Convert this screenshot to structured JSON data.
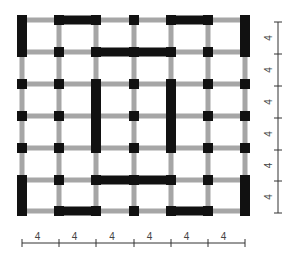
{
  "diagram": {
    "type": "structural-floor-plan-grid",
    "grid": {
      "columns_x": [
        22,
        59,
        96,
        134,
        171,
        208,
        245
      ],
      "rows_y": [
        20,
        52,
        84,
        116,
        148,
        180,
        211
      ]
    },
    "colors": {
      "beam": "#a6a6a6",
      "column": "#111111",
      "wall": "#111111",
      "axis": "#333333",
      "label": "#444444"
    },
    "shear_walls": [
      {
        "orientation": "v",
        "col": 0,
        "from": 0,
        "to": 1
      },
      {
        "orientation": "v",
        "col": 0,
        "from": 5,
        "to": 6
      },
      {
        "orientation": "v",
        "col": 6,
        "from": 0,
        "to": 1
      },
      {
        "orientation": "v",
        "col": 6,
        "from": 5,
        "to": 6
      },
      {
        "orientation": "h",
        "row": 0,
        "from": 1,
        "to": 2
      },
      {
        "orientation": "h",
        "row": 0,
        "from": 4,
        "to": 5
      },
      {
        "orientation": "h",
        "row": 6,
        "from": 1,
        "to": 2
      },
      {
        "orientation": "h",
        "row": 6,
        "from": 4,
        "to": 5
      },
      {
        "orientation": "h",
        "row": 1,
        "from": 2,
        "to": 4
      },
      {
        "orientation": "h",
        "row": 5,
        "from": 2,
        "to": 4
      },
      {
        "orientation": "v",
        "col": 2,
        "from": 2,
        "to": 4
      },
      {
        "orientation": "v",
        "col": 4,
        "from": 2,
        "to": 4
      }
    ],
    "dimension_axes": {
      "bottom": {
        "y": 243,
        "ticks_x": [
          22,
          59,
          96,
          134,
          171,
          208,
          245
        ],
        "labels": [
          "4",
          "4",
          "4",
          "4",
          "4",
          "4"
        ]
      },
      "right": {
        "x": 278,
        "ticks_y": [
          22,
          54,
          86,
          118,
          150,
          181,
          213
        ],
        "labels": [
          "4",
          "4",
          "4",
          "4",
          "4",
          "4"
        ]
      }
    }
  }
}
